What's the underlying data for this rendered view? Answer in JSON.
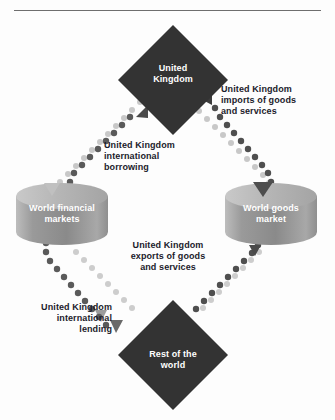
{
  "diagram": {
    "type": "flow-diagram",
    "colors": {
      "diamond_fill": "#333333",
      "cylinder_body": "#8c8c8c",
      "cylinder_top": "#b4b4b4",
      "flow_dark": "#555555",
      "flow_light": "#c4c4c4",
      "label_text": "#1b1b2b",
      "node_text": "#ffffff",
      "rule": "#6e6e6e"
    }
  },
  "nodes": {
    "uk": {
      "label_line1": "United",
      "label_line2": "Kingdom",
      "shape": "diamond"
    },
    "rest_of_world": {
      "label_line1": "Rest of the",
      "label_line2": "world",
      "shape": "diamond"
    },
    "financial_markets": {
      "label_line1": "World financial",
      "label_line2": "markets",
      "shape": "cylinder"
    },
    "goods_market": {
      "label_line1": "World goods",
      "label_line2": "market",
      "shape": "cylinder"
    }
  },
  "flows": [
    {
      "id": "uk-imports",
      "line1": "United Kingdom",
      "line2": "imports of goods",
      "line3": "and services",
      "from": "goods_market",
      "to": "uk",
      "style": "dark-dotted",
      "align": "left"
    },
    {
      "id": "uk-borrowing",
      "line1": "United Kingdom",
      "line2": "international",
      "line3": "borrowing",
      "from": "financial_markets",
      "to": "uk",
      "style": "dark-dotted",
      "align": "left"
    },
    {
      "id": "uk-exports",
      "line1": "United Kingdom",
      "line2": "exports of goods",
      "line3": "and services",
      "from": "rest_of_world",
      "to": "goods_market",
      "style": "dark-dotted",
      "align": "center"
    },
    {
      "id": "uk-lending",
      "line1": "United Kingdom",
      "line2": "international",
      "line3": "lending",
      "from": "financial_markets",
      "to": "rest_of_world",
      "style": "dark-dotted",
      "align": "right"
    }
  ]
}
